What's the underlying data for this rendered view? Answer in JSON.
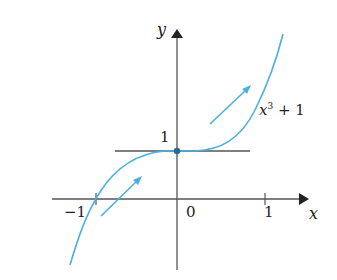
{
  "figure": {
    "function_label": "x³ + 1",
    "function_base": "x",
    "function_exp": "3",
    "function_rest": " + 1",
    "x_axis_label": "x",
    "y_axis_label": "y",
    "x_ticks": [
      "−1",
      "0",
      "1"
    ],
    "y_ticks": [
      "1"
    ],
    "curve_color": "#4ab0e0",
    "axis_color": "#555555",
    "point": {
      "x": 0,
      "y": 1
    },
    "horizontal_tangent_at": {
      "x": 0,
      "y": 1
    },
    "arrows": [
      "increasing-left",
      "increasing-right"
    ]
  }
}
